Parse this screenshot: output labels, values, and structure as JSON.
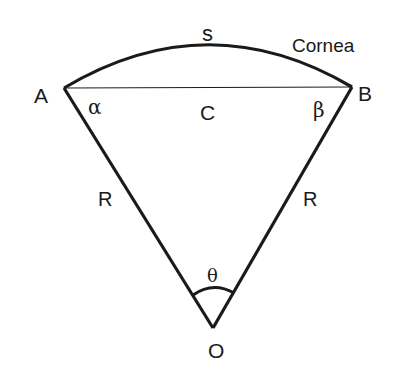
{
  "diagram": {
    "labels": {
      "point_a": "A",
      "point_b": "B",
      "point_o": "O",
      "arc": "s",
      "cornea": "Cornea",
      "chord": "C",
      "alpha": "α",
      "beta": "β",
      "radius_left": "R",
      "radius_right": "R",
      "theta": "θ"
    },
    "colors": {
      "stroke": "#1a1a1a",
      "background": "#ffffff"
    }
  }
}
